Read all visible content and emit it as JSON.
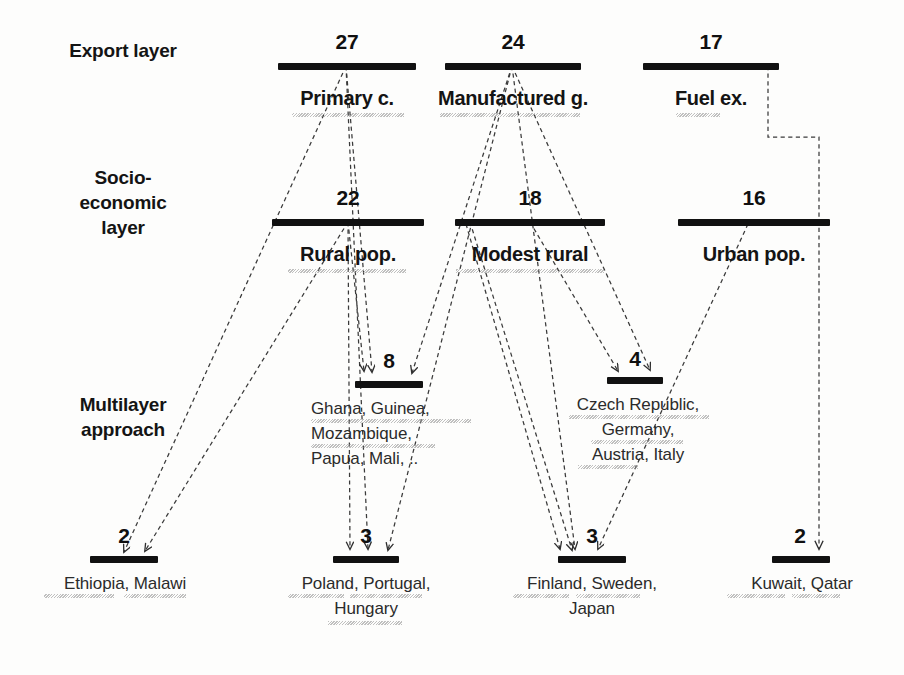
{
  "figure": {
    "background_color": "#fdfdfc",
    "bar_color": "#111111",
    "edge_color": "#3a3a3a"
  },
  "row_labels": [
    {
      "id": "export-layer",
      "text": "Export layer"
    },
    {
      "id": "socio-economic-layer",
      "text": "Socio-\neconomic\nlayer"
    },
    {
      "id": "multilayer-approach",
      "text": "Multilayer\napproach"
    }
  ],
  "layers": [
    {
      "id": "export-layer",
      "name": "Export layer",
      "nodes": [
        {
          "id": "primary-c",
          "count": "27",
          "name": "Primary c.",
          "countries": ""
        },
        {
          "id": "manufactured-g",
          "count": "24",
          "name": "Manufactured g.",
          "countries": ""
        },
        {
          "id": "fuel-ex",
          "count": "17",
          "name": "Fuel ex.",
          "countries": ""
        }
      ]
    },
    {
      "id": "socio-economic-layer",
      "name": "Socio-economic layer",
      "nodes": [
        {
          "id": "rural-pop",
          "count": "22",
          "name": "Rural pop.",
          "countries": ""
        },
        {
          "id": "modest-rural",
          "count": "18",
          "name": "Modest rural",
          "countries": ""
        },
        {
          "id": "urban-pop",
          "count": "16",
          "name": "Urban pop.",
          "countries": ""
        }
      ]
    },
    {
      "id": "multilayer-upper",
      "name": "Multilayer approach (upper)",
      "nodes": [
        {
          "id": "ghana-group",
          "count": "8",
          "name": "",
          "countries": "Ghana, Guinea,\nMozambique,\nPapua, Mali, .."
        },
        {
          "id": "czech-group",
          "count": "4",
          "name": "",
          "countries": "Czech Republic,\nGermany,\nAustria, Italy"
        }
      ]
    },
    {
      "id": "multilayer-lower",
      "name": "Multilayer approach (lower)",
      "nodes": [
        {
          "id": "ethiopia-group",
          "count": "2",
          "name": "",
          "countries": "Ethiopia, Malawi"
        },
        {
          "id": "poland-group",
          "count": "3",
          "name": "",
          "countries": "Poland, Portugal,\nHungary"
        },
        {
          "id": "finland-group",
          "count": "3",
          "name": "",
          "countries": "Finland, Sweden,\nJapan"
        },
        {
          "id": "kuwait-group",
          "count": "2",
          "name": "",
          "countries": "Kuwait, Qatar"
        }
      ]
    }
  ],
  "edges": [
    {
      "id": "primary-c-to-ethiopia",
      "from": "primary-c",
      "to": "ethiopia-group"
    },
    {
      "id": "primary-c-to-ghana",
      "from": "primary-c",
      "to": "ghana-group"
    },
    {
      "id": "primary-c-to-poland",
      "from": "primary-c",
      "to": "poland-group"
    },
    {
      "id": "manufactured-g-to-ghana",
      "from": "manufactured-g",
      "to": "ghana-group"
    },
    {
      "id": "manufactured-g-to-poland",
      "from": "manufactured-g",
      "to": "poland-group"
    },
    {
      "id": "manufactured-g-to-finland",
      "from": "manufactured-g",
      "to": "finland-group"
    },
    {
      "id": "manufactured-g-to-czech",
      "from": "manufactured-g",
      "to": "czech-group"
    },
    {
      "id": "fuel-ex-to-kuwait",
      "from": "fuel-ex",
      "to": "kuwait-group"
    },
    {
      "id": "rural-pop-to-ethiopia",
      "from": "rural-pop",
      "to": "ethiopia-group"
    },
    {
      "id": "rural-pop-to-ghana",
      "from": "rural-pop",
      "to": "ghana-group"
    },
    {
      "id": "rural-pop-to-poland",
      "from": "rural-pop",
      "to": "poland-group"
    },
    {
      "id": "modest-rural-to-czech",
      "from": "modest-rural",
      "to": "czech-group"
    },
    {
      "id": "modest-rural-to-finland",
      "from": "modest-rural",
      "to": "finland-group"
    },
    {
      "id": "modest-rural-to-poland",
      "from": "modest-rural",
      "to": "poland-group"
    },
    {
      "id": "urban-pop-to-finland",
      "from": "urban-pop",
      "to": "finland-group"
    }
  ],
  "nodes_geometry": {
    "primary_c": {
      "bar_x": 278,
      "bar_y": 63,
      "bar_w": 138,
      "count_y": 32,
      "name_y": 88
    },
    "manufactured_g": {
      "bar_x": 445,
      "bar_y": 63,
      "bar_w": 136,
      "count_y": 32,
      "name_y": 88
    },
    "fuel_ex": {
      "bar_x": 643,
      "bar_y": 63,
      "bar_w": 136,
      "count_y": 32,
      "name_y": 88
    },
    "rural_pop": {
      "bar_x": 272,
      "bar_y": 219,
      "bar_w": 152,
      "count_y": 188,
      "name_y": 244
    },
    "modest_rural": {
      "bar_x": 455,
      "bar_y": 219,
      "bar_w": 150,
      "count_y": 188,
      "name_y": 244
    },
    "urban_pop": {
      "bar_x": 678,
      "bar_y": 219,
      "bar_w": 152,
      "count_y": 188,
      "name_y": 244
    },
    "ghana_group": {
      "bar_x": 355,
      "bar_y": 381,
      "bar_w": 68,
      "count_y": 352,
      "name_y": 394
    },
    "czech_group": {
      "bar_x": 607,
      "bar_y": 377,
      "bar_w": 56,
      "count_y": 350,
      "name_y": 390
    },
    "ethiopia_group": {
      "bar_x": 90,
      "bar_y": 556,
      "bar_w": 68,
      "count_y": 527,
      "name_y": 568
    },
    "poland_group": {
      "bar_x": 333,
      "bar_y": 556,
      "bar_w": 66,
      "count_y": 527,
      "name_y": 568
    },
    "finland_group": {
      "bar_x": 558,
      "bar_y": 556,
      "bar_w": 68,
      "count_y": 527,
      "name_y": 568
    },
    "kuwait_group": {
      "bar_x": 772,
      "bar_y": 556,
      "bar_w": 58,
      "count_y": 527,
      "name_y": 568
    }
  }
}
